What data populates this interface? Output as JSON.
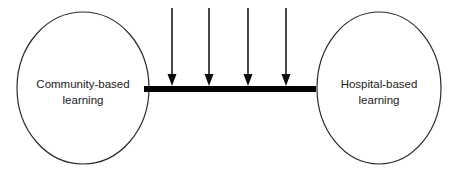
{
  "diagram": {
    "type": "conceptual-diagram",
    "canvas": {
      "width": 456,
      "height": 178,
      "background": "#ffffff"
    },
    "nodes": [
      {
        "id": "community-based-learning",
        "shape": "ellipse",
        "label_line1": "Community-based",
        "label_line2": "learning",
        "cx": 83,
        "cy": 88,
        "rx": 66,
        "ry": 76,
        "stroke": "#2b2b2b",
        "fill": "#ffffff"
      },
      {
        "id": "hospital-based-learning",
        "shape": "ellipse",
        "label_line1": "Hospital-based",
        "label_line2": "learning",
        "cx": 379,
        "cy": 88,
        "rx": 62,
        "ry": 76,
        "stroke": "#2b2b2b",
        "fill": "#ffffff"
      }
    ],
    "connector": {
      "id": "beam-bar",
      "shape": "bar",
      "x1": 144,
      "x2": 316,
      "y": 89,
      "thickness": 6,
      "color": "#000000"
    },
    "arrows": [
      {
        "id": "load-arrow-1",
        "x": 172,
        "y_top": 8,
        "y_bottom": 86
      },
      {
        "id": "load-arrow-2",
        "x": 209,
        "y_top": 8,
        "y_bottom": 86
      },
      {
        "id": "load-arrow-3",
        "x": 248,
        "y_top": 8,
        "y_bottom": 86
      },
      {
        "id": "load-arrow-4",
        "x": 286,
        "y_top": 8,
        "y_bottom": 86
      }
    ],
    "arrow_style": {
      "line_color": "#1a1a1a",
      "line_width": 1.6,
      "head_color": "#0d0d0d",
      "head_width": 9,
      "head_length": 13,
      "direction": "down"
    },
    "colors": {
      "outline": "#2b2b2b",
      "bar": "#000000",
      "text": "#1a1a1a",
      "background": "#ffffff"
    }
  }
}
